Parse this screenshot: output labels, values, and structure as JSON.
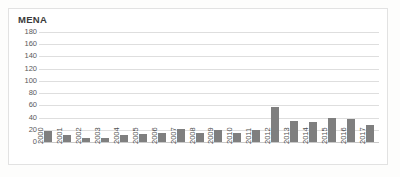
{
  "chart_data": {
    "type": "bar",
    "title": "MENA",
    "xlabel": "",
    "ylabel": "",
    "ylim": [
      0,
      180
    ],
    "yticks": [
      180,
      160,
      140,
      120,
      100,
      80,
      60,
      40,
      20,
      0
    ],
    "grid": true,
    "legend": "none",
    "bar_color": "#7f7f7f",
    "categories": [
      "2000",
      "2001",
      "2002",
      "2003",
      "2004",
      "2005",
      "2006",
      "2007",
      "2008",
      "2009",
      "2010",
      "2011",
      "2012",
      "2013",
      "2014",
      "2015",
      "2016",
      "2017"
    ],
    "values": [
      18,
      11,
      6,
      7,
      11,
      13,
      15,
      22,
      14,
      19,
      14,
      20,
      57,
      35,
      33,
      40,
      38,
      28
    ]
  },
  "colors": {
    "bar": "#7f7f7f",
    "gridline": "#dedede",
    "axis": "#c9c9c9",
    "text": "#4f4f4f",
    "title": "#3b3b3b",
    "frame_border": "#e2e2e2",
    "background": "#ffffff"
  }
}
